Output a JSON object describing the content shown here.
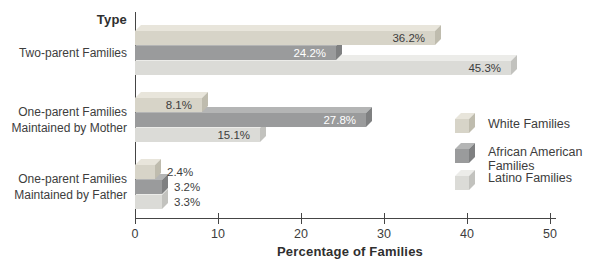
{
  "chart": {
    "y_axis_title": "Type",
    "x_axis_title": "Percentage of Families"
  },
  "chart_data": {
    "type": "bar",
    "orientation": "horizontal",
    "title": "",
    "xlabel": "Percentage of Families",
    "ylabel": "Type",
    "xlim": [
      0,
      50
    ],
    "xticks": [
      0,
      10,
      20,
      30,
      40,
      50
    ],
    "grid": false,
    "legend_position": "right",
    "categories": [
      "Two-parent Families",
      "One-parent Families Maintained by Mother",
      "One-parent Families Maintained by Father"
    ],
    "category_label_lines": [
      [
        "Two-parent Families"
      ],
      [
        "One-parent Families",
        "Maintained by Mother"
      ],
      [
        "One-parent Families",
        "Maintained by Father"
      ]
    ],
    "series": [
      {
        "name": "White Families",
        "color_key": "white_families",
        "inside_label_color": "#3d3d3d",
        "values": [
          36.2,
          8.1,
          2.4
        ],
        "data_labels": [
          "36.2%",
          "8.1%",
          "2.4%"
        ]
      },
      {
        "name": "African American Families",
        "color_key": "african_american_families",
        "inside_label_color": "#ffffff",
        "values": [
          24.2,
          27.8,
          3.2
        ],
        "data_labels": [
          "24.2%",
          "27.8%",
          "3.2%"
        ]
      },
      {
        "name": "Latino Families",
        "color_key": "latino_families",
        "inside_label_color": "#3d3d3d",
        "values": [
          45.3,
          15.1,
          3.3
        ],
        "data_labels": [
          "45.3%",
          "15.1%",
          "3.3%"
        ]
      }
    ]
  },
  "legend": {
    "items": [
      {
        "color_key": "white_families",
        "lines": [
          "White Families"
        ]
      },
      {
        "color_key": "african_american_families",
        "lines": [
          "African American",
          "Families"
        ]
      },
      {
        "color_key": "latino_families",
        "lines": [
          "Latino Families"
        ]
      }
    ]
  },
  "colors": {
    "white_families": {
      "top": "#e8e5db",
      "face": "#d7d4c8",
      "side": "#bfbcae"
    },
    "african_american_families": {
      "top": "#b4b5b5",
      "face": "#9a9b9c",
      "side": "#7f8081"
    },
    "latino_families": {
      "top": "#ecece9",
      "face": "#dbdbd7",
      "side": "#c2c2be"
    },
    "axis": "#454545",
    "text": "#3d3d3d",
    "label_on_dark": "#ffffff"
  }
}
